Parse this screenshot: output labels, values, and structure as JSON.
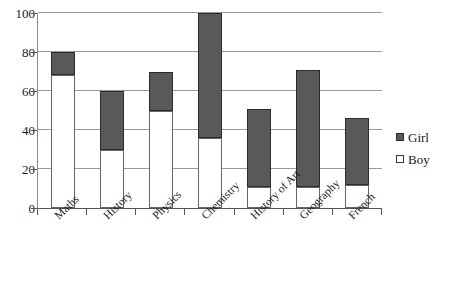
{
  "chart_data": {
    "type": "bar",
    "subtype": "stacked-bar",
    "title": "",
    "xlabel": "",
    "ylabel": "",
    "ylim": [
      0,
      100
    ],
    "yticks": [
      0,
      20,
      40,
      60,
      80,
      100
    ],
    "grid": true,
    "legend_position": "right",
    "categories": [
      "Maths",
      "History",
      "Physics",
      "Chemistry",
      "History of Art",
      "Geography",
      "French"
    ],
    "series": [
      {
        "name": "Boy",
        "color": "#ffffff",
        "values": [
          68,
          30,
          50,
          36,
          11,
          11,
          12
        ]
      },
      {
        "name": "Girl",
        "color": "#595959",
        "values": [
          12,
          30,
          20,
          64,
          40,
          60,
          34
        ]
      }
    ],
    "totals": [
      80,
      60,
      70,
      100,
      51,
      71,
      46
    ]
  },
  "legend": {
    "items": [
      {
        "label": "Girl",
        "swatch": "filled-gray-square"
      },
      {
        "label": "Boy",
        "swatch": "empty-white-square"
      }
    ]
  },
  "axis": {
    "y_tick_labels": [
      "100",
      "80",
      "60",
      "40",
      "20",
      "0"
    ]
  }
}
